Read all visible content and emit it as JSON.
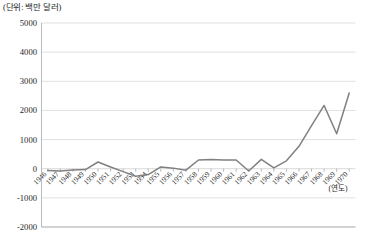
{
  "title": "(단위: 백만 달러)",
  "axis_unit_note": "(연도)",
  "chart_data": {
    "type": "line",
    "title": "(단위: 백만 달러)",
    "xlabel": "(연도)",
    "ylabel": "",
    "ylim": [
      -2000,
      5000
    ],
    "ytick_labels": [
      "5000",
      "4000",
      "3000",
      "2000",
      "1000",
      "0",
      "-1000",
      "-2000"
    ],
    "ytick_values": [
      5000,
      4000,
      3000,
      2000,
      1000,
      0,
      -1000,
      -2000
    ],
    "grid": true,
    "legend": "none",
    "line_color": "#808080",
    "categories": [
      "1946",
      "1947",
      "1948",
      "1949",
      "1950",
      "1951",
      "1952",
      "1953",
      "1954",
      "1955",
      "1956",
      "1957",
      "1958",
      "1959",
      "1960",
      "1961",
      "1962",
      "1963",
      "1964",
      "1965",
      "1966",
      "1967",
      "1968",
      "1969",
      "1970"
    ],
    "series": [
      {
        "name": "무역수지",
        "values": [
          -60,
          -80,
          -40,
          -30,
          230,
          60,
          -100,
          -260,
          -200,
          60,
          20,
          -50,
          300,
          320,
          300,
          300,
          -80,
          320,
          30,
          270,
          770,
          1480,
          2170,
          1200,
          2600
        ]
      }
    ],
    "values_note": "최종 연도 1970 값 약 3980"
  }
}
